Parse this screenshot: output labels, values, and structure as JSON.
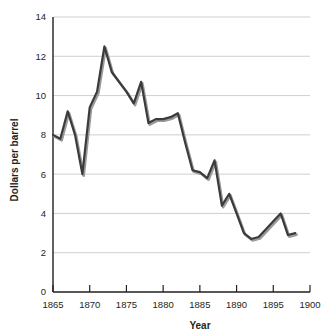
{
  "chart_data": {
    "type": "line",
    "title": "",
    "xlabel": "Year",
    "ylabel": "Dollars per barrel",
    "xlim": [
      1865,
      1900
    ],
    "ylim": [
      0,
      14
    ],
    "grid": true,
    "legend": false,
    "legend_position": "none",
    "x_tick_labels": [
      "1865",
      "1870",
      "1875",
      "1880",
      "1885",
      "1890",
      "1895",
      "1900"
    ],
    "x_ticks": [
      1865,
      1870,
      1875,
      1880,
      1885,
      1890,
      1895,
      1900
    ],
    "y_tick_labels": [
      "0",
      "2",
      "4",
      "6",
      "8",
      "10",
      "12",
      "14"
    ],
    "y_ticks": [
      0,
      2,
      4,
      6,
      8,
      10,
      12,
      14
    ],
    "line_color": "#3b3b3b",
    "shadow_color": "#9a9a9a",
    "grid_color": "#c9c9c9",
    "axis_color": "#231f20",
    "background_color": "#ffffff",
    "x": [
      1865,
      1866,
      1867,
      1868,
      1869,
      1870,
      1871,
      1872,
      1873,
      1874,
      1875,
      1876,
      1877,
      1878,
      1879,
      1880,
      1881,
      1882,
      1883,
      1884,
      1885,
      1886,
      1887,
      1888,
      1889,
      1890,
      1891,
      1892,
      1893,
      1894,
      1895,
      1896,
      1897,
      1898
    ],
    "values": [
      8.0,
      7.8,
      9.2,
      8.0,
      6.0,
      9.4,
      10.2,
      12.5,
      11.2,
      10.7,
      10.2,
      9.6,
      10.7,
      8.6,
      8.8,
      8.8,
      8.9,
      9.1,
      7.6,
      6.2,
      6.1,
      5.8,
      6.7,
      4.4,
      5.0,
      4.0,
      3.0,
      2.7,
      2.8,
      3.2,
      3.6,
      4.0,
      2.9,
      3.0
    ],
    "series": [
      {
        "name": "Dollars per barrel",
        "values": [
          8.0,
          7.8,
          9.2,
          8.0,
          6.0,
          9.4,
          10.2,
          12.5,
          11.2,
          10.7,
          10.2,
          9.6,
          10.7,
          8.6,
          8.8,
          8.8,
          8.9,
          9.1,
          7.6,
          6.2,
          6.1,
          5.8,
          6.7,
          4.4,
          5.0,
          4.0,
          3.0,
          2.7,
          2.8,
          3.2,
          3.6,
          4.0,
          2.9,
          3.0
        ]
      }
    ]
  }
}
